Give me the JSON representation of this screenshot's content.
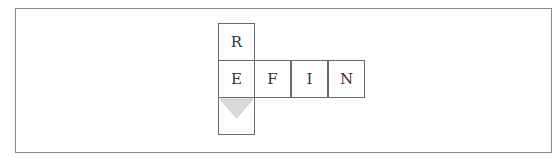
{
  "diagram": {
    "type": "letter-grid",
    "cells": [
      {
        "letter": "R",
        "col": 0,
        "row": 0
      },
      {
        "letter": "E",
        "col": 0,
        "row": 1
      },
      {
        "letter": "F",
        "col": 1,
        "row": 1
      },
      {
        "letter": "I",
        "col": 2,
        "row": 1
      },
      {
        "letter": "N",
        "col": 3,
        "row": 1
      },
      {
        "letter": "",
        "col": 0,
        "row": 2,
        "marker": "down-triangle"
      }
    ],
    "marker_color": "#d9d9d9"
  }
}
